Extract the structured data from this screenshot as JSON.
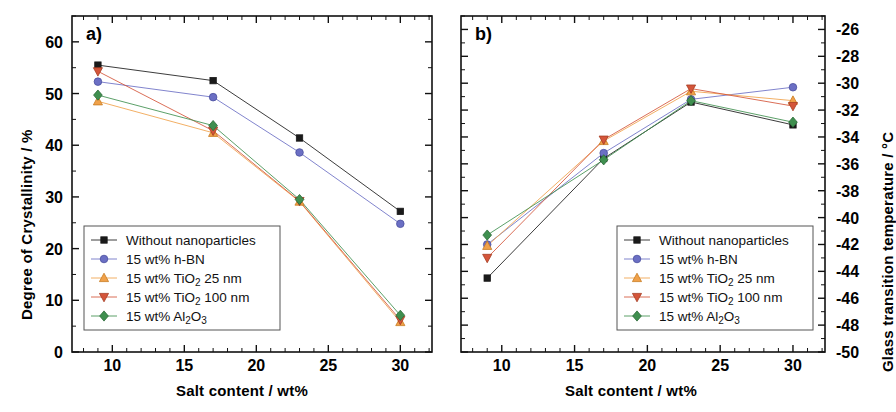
{
  "figure": {
    "background": "#ffffff",
    "panels": [
      {
        "tag": "a)",
        "xlabel": "Salt content / wt%",
        "ylabel": "Degree of Crystallinity / %"
      },
      {
        "tag": "b)",
        "xlabel": "Salt content / wt%",
        "ylabel": "Glass transition temperature / °C"
      }
    ]
  },
  "series_meta": [
    {
      "key": "none",
      "label": "Without nanoparticles",
      "color": "#1a1a1a",
      "marker": "square"
    },
    {
      "key": "hbn",
      "label": "15 wt% h-BN",
      "color": "#6b6fc4",
      "marker": "circle"
    },
    {
      "key": "tio2_25",
      "label_pre": "15 wt% TiO",
      "label_sub": "2",
      "label_post": " 25 nm",
      "label": "15 wt% TiO2 25 nm",
      "color": "#f0a14a",
      "marker": "triangle-up"
    },
    {
      "key": "tio2_100",
      "label_pre": "15 wt% TiO",
      "label_sub": "2",
      "label_post": " 100 nm",
      "label": "15 wt% TiO2 100 nm",
      "color": "#d4553a",
      "marker": "triangle-down"
    },
    {
      "key": "al2o3",
      "label_pre": "15 wt% Al",
      "label_sub": "2",
      "label_mid": "O",
      "label_sub2": "3",
      "label": "15 wt% Al2O3",
      "color": "#3f8f4f",
      "marker": "diamond"
    }
  ],
  "chart_data": [
    {
      "type": "line",
      "panel": "a)",
      "title": "",
      "xlabel": "Salt content / wt%",
      "ylabel": "Degree of Crystallinity / %",
      "x": [
        9,
        17,
        23,
        30
      ],
      "xlim": [
        7.2,
        32.2
      ],
      "ylim": [
        0,
        65
      ],
      "xticks": [
        10,
        15,
        20,
        25,
        30
      ],
      "yticks": [
        0,
        10,
        20,
        30,
        40,
        50,
        60
      ],
      "xminor_step": 1,
      "yminor_step": 5,
      "grid": false,
      "legend_position": "lower-left",
      "series": [
        {
          "name": "Without nanoparticles",
          "values": [
            55.5,
            52.5,
            41.4,
            27.2
          ]
        },
        {
          "name": "15 wt% h-BN",
          "values": [
            52.3,
            49.3,
            38.6,
            24.8
          ]
        },
        {
          "name": "15 wt% TiO2 25 nm",
          "values": [
            48.5,
            42.4,
            29.1,
            5.8
          ]
        },
        {
          "name": "15 wt% TiO2 100 nm",
          "values": [
            54.3,
            42.8,
            29.2,
            6.2
          ]
        },
        {
          "name": "15 wt% Al2O3",
          "values": [
            49.7,
            43.8,
            29.5,
            7.1
          ]
        }
      ]
    },
    {
      "type": "line",
      "panel": "b)",
      "title": "",
      "xlabel": "Salt content / wt%",
      "ylabel": "Glass transition temperature / °C",
      "x": [
        9,
        17,
        23,
        30
      ],
      "xlim": [
        7.2,
        32.2
      ],
      "ylim": [
        -50,
        -25
      ],
      "xticks": [
        10,
        15,
        20,
        25,
        30
      ],
      "yticks": [
        -26,
        -28,
        -30,
        -32,
        -34,
        -36,
        -38,
        -40,
        -42,
        -44,
        -46,
        -48,
        -50
      ],
      "xminor_step": 1,
      "yminor_step": 1,
      "grid": false,
      "legend_position": "lower-right",
      "yaxis_side": "right",
      "series": [
        {
          "name": "Without nanoparticles",
          "values": [
            -44.5,
            -35.6,
            -31.4,
            -33.1
          ]
        },
        {
          "name": "15 wt% h-BN",
          "values": [
            -42.0,
            -35.2,
            -31.2,
            -30.3
          ]
        },
        {
          "name": "15 wt% TiO2 25 nm",
          "values": [
            -42.1,
            -34.3,
            -30.6,
            -31.3
          ]
        },
        {
          "name": "15 wt% TiO2 100 nm",
          "values": [
            -43.0,
            -34.2,
            -30.4,
            -31.7
          ]
        },
        {
          "name": "15 wt% Al2O3",
          "values": [
            -41.3,
            -35.7,
            -31.3,
            -32.9
          ]
        }
      ]
    }
  ]
}
